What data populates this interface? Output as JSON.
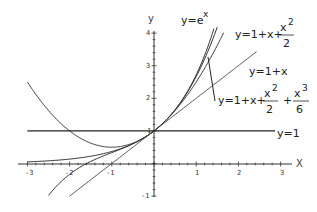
{
  "chart_data": {
    "type": "line",
    "title": "",
    "xlabel": "x",
    "ylabel": "y",
    "xlim": [
      -3,
      3
    ],
    "ylim": [
      -1,
      4
    ],
    "grid": false,
    "x_ticks": [
      "-3",
      "-2",
      "-1",
      "1",
      "2",
      "3"
    ],
    "y_ticks": [
      "-1",
      "1",
      "2",
      "3",
      "4"
    ],
    "series": [
      {
        "name": "y=e^x",
        "expr": "exp",
        "x_range": [
          -3,
          1.42
        ],
        "color": "#333333"
      },
      {
        "name": "y=1+x+x^2/2",
        "expr": "quad",
        "x_range": [
          -3,
          1.65
        ],
        "color": "#444444"
      },
      {
        "name": "y=1+x",
        "expr": "lin",
        "x_range": [
          -2.0,
          2.43
        ],
        "color": "#555555"
      },
      {
        "name": "y=1+x+x^2/2+x^3/6",
        "expr": "cubic",
        "x_range": [
          -2.5,
          1.5
        ],
        "color": "#333333"
      },
      {
        "name": "y=1",
        "expr": "const",
        "x_range": [
          -3,
          2.87
        ],
        "color": "#222222"
      }
    ],
    "annotations": [
      {
        "text": "y=e^x",
        "near": "top of exponential curve"
      },
      {
        "text": "y=1+x+x^2/2",
        "near": "top right"
      },
      {
        "text": "y=1+x",
        "near": "end of tangent line"
      },
      {
        "text": "y=1+x+x^2/2+x^3/6",
        "near": "pointer to cubic"
      },
      {
        "text": "y=1",
        "near": "right end of horizontal line"
      }
    ]
  },
  "labels": {
    "x_axis": "X",
    "y_axis": "y",
    "exp": {
      "base": "y=e",
      "sup": "x"
    },
    "quad": {
      "prefix": "y=1+x+",
      "num": "x",
      "num_sup": "2",
      "den": "2"
    },
    "lin": "y=1+x",
    "cubic": {
      "prefix": "y=1+x+",
      "num1": "x",
      "sup1": "2",
      "den1": "2",
      "plus": "+",
      "num2": "x",
      "sup2": "3",
      "den2": "6"
    },
    "const": "y=1",
    "one_origin": "1"
  }
}
